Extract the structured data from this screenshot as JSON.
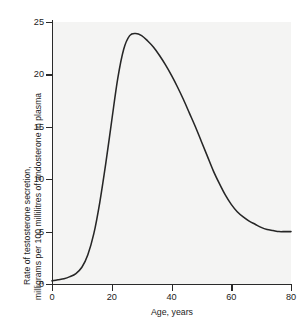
{
  "chart_data": {
    "type": "line",
    "title": "",
    "xlabel": "Age, years",
    "ylabel_line1": "Rate of testosterone secretion,",
    "ylabel_line2": "milligrams per 100 millilitres of andosterone in plasma",
    "xlim": [
      0,
      80
    ],
    "ylim": [
      0,
      25
    ],
    "xticks": [
      0,
      20,
      40,
      60,
      80
    ],
    "xtick_labels": [
      "0",
      "20",
      "40",
      "60",
      "80"
    ],
    "yticks": [
      0,
      5,
      10,
      15,
      20,
      25
    ],
    "ytick_labels": [
      "0",
      "5",
      "10",
      "15",
      "20",
      "25"
    ],
    "grid": false,
    "legend": false,
    "legend_position": "none",
    "line_color": "#262626",
    "background_color": "#f4f4f3",
    "axis_color": "#2a2a2a",
    "series": [
      {
        "name": "Testosterone secretion rate",
        "x": [
          0,
          2,
          4,
          6,
          8,
          10,
          12,
          14,
          16,
          18,
          20,
          22,
          24,
          26,
          28,
          30,
          32,
          34,
          36,
          38,
          40,
          42,
          44,
          46,
          48,
          50,
          52,
          54,
          56,
          58,
          60,
          62,
          64,
          66,
          68,
          70,
          72,
          74,
          76,
          78,
          80
        ],
        "values": [
          0.3,
          0.4,
          0.5,
          0.7,
          1.0,
          1.6,
          2.8,
          4.8,
          7.8,
          11.5,
          15.6,
          19.6,
          22.4,
          23.7,
          23.9,
          23.7,
          23.2,
          22.6,
          21.8,
          20.9,
          19.9,
          18.8,
          17.6,
          16.3,
          15.0,
          13.6,
          12.2,
          10.8,
          9.6,
          8.5,
          7.6,
          6.9,
          6.4,
          6.0,
          5.7,
          5.4,
          5.2,
          5.1,
          5.0,
          5.0,
          5.0
        ]
      }
    ],
    "annotations": {
      "peak_age": 27,
      "peak_value": 23.9,
      "plateau_value": 5.0
    }
  }
}
